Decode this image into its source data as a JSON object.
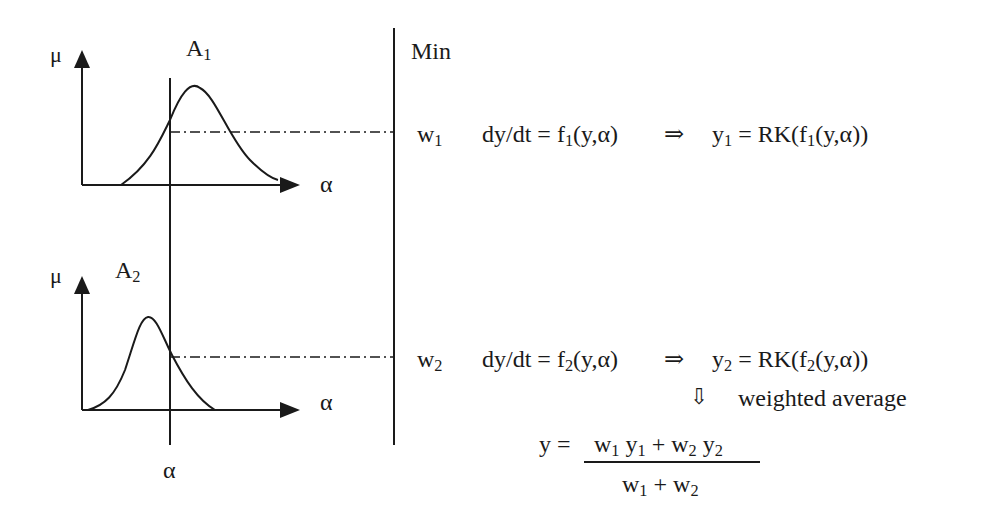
{
  "diagram": {
    "type": "fuzzy-inference-weighted-average",
    "panels": [
      {
        "name": "A1",
        "label_base": "A",
        "label_sub": "1",
        "y_axis_label": "μ",
        "x_axis_label": "α",
        "curve": "asymmetric bell, peak right of α cut"
      },
      {
        "name": "A2",
        "label_base": "A",
        "label_sub": "2",
        "y_axis_label": "μ",
        "x_axis_label": "α",
        "curve": "bell, peak left of α cut"
      }
    ],
    "alpha_label": "α",
    "operator_label": "Min",
    "rules": [
      {
        "weight_base": "w",
        "weight_sub": "1",
        "ode_lhs": "dy/dt = ",
        "f_base": "f",
        "f_sub": "1",
        "f_args": "(y,α)",
        "implies": "⇒",
        "y_base": "y",
        "y_sub": "1",
        "rk_prefix": " = RK(",
        "rk_f_base": "f",
        "rk_f_sub": "1",
        "rk_suffix": "(y,α))"
      },
      {
        "weight_base": "w",
        "weight_sub": "2",
        "ode_lhs": "dy/dt = ",
        "f_base": "f",
        "f_sub": "2",
        "f_args": "(y,α)",
        "implies": "⇒",
        "y_base": "y",
        "y_sub": "2",
        "rk_prefix": " = RK(",
        "rk_f_base": "f",
        "rk_f_sub": "2",
        "rk_suffix": "(y,α))"
      }
    ],
    "down_arrow": "⇩",
    "aggregation_label": "weighted average",
    "result": {
      "lhs": "y = ",
      "numerator": {
        "w1": "w",
        "w1_sub": "1",
        "y1": " y",
        "y1_sub": "1",
        "plus": " + ",
        "w2": "w",
        "w2_sub": "2",
        "y2": " y",
        "y2_sub": "2"
      },
      "denominator": {
        "w1": "w",
        "w1_sub": "1",
        "plus": " + ",
        "w2": "w",
        "w2_sub": "2"
      }
    }
  },
  "colors": {
    "ink": "#1a1a1a",
    "background": "#ffffff"
  }
}
